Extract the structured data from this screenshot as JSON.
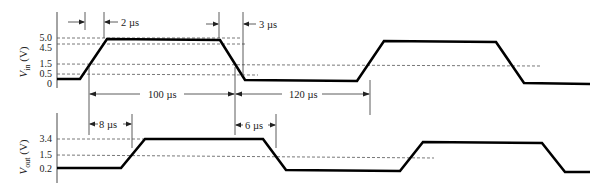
{
  "vin": {
    "axis_label": "V_in (V)",
    "axis_label_main": "V",
    "axis_label_sub": "in",
    "axis_label_unit": " (V)",
    "ticks": [
      "5.0",
      "4.5",
      "1.5",
      "0.5",
      "0"
    ]
  },
  "vout": {
    "axis_label": "V_out (V)",
    "axis_label_main": "V",
    "axis_label_sub": "out",
    "axis_label_unit": " (V)",
    "ticks": [
      "3.4",
      "1.5",
      "0.2"
    ]
  },
  "annotations": {
    "rise_time_in": "2 µs",
    "fall_time_in": "3 µs",
    "high_duration": "100 µs",
    "low_duration": "120 µs",
    "delay_rise": "8 µs",
    "delay_fall": "6 µs"
  }
}
